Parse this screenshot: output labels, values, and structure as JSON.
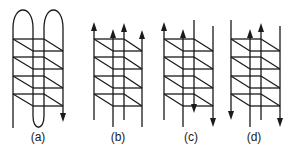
{
  "diagram": {
    "ink_color": "#1a1a1a",
    "background": "#ffffff",
    "rung_tops": [
      39,
      57,
      76,
      94
    ],
    "rung_depth": 12,
    "panels": [
      {
        "id": "a",
        "label": "(a)",
        "label_x": 38,
        "strands": {
          "front_left": 13,
          "back_left": 33,
          "front_right": 44,
          "back_right": 63
        },
        "topology": "single-chain-hairpins",
        "loops": [
          {
            "type": "top",
            "from": "front_left",
            "to": "back_left",
            "apex_y": 10
          },
          {
            "type": "top",
            "from": "front_right",
            "to": "back_right",
            "apex_y": 10
          },
          {
            "type": "bottom",
            "from": "back_left",
            "to": "front_right",
            "apex_y": 127
          }
        ],
        "ends": [
          {
            "strand": "front_left",
            "y": 128,
            "arrow": "none"
          },
          {
            "strand": "back_right",
            "y": 122,
            "arrow": "down"
          }
        ]
      },
      {
        "id": "b",
        "label": "(b)",
        "label_x": 118,
        "strands": {
          "front_left": 94,
          "back_left": 113,
          "front_right": 124,
          "back_right": 142
        },
        "topology": "all-parallel",
        "directions": {
          "front_left": "up",
          "back_left": "up",
          "front_right": "up",
          "back_right": "up"
        }
      },
      {
        "id": "c",
        "label": "(c)",
        "label_x": 191,
        "strands": {
          "front_left": 164,
          "back_left": 183,
          "front_right": 194,
          "back_right": 213
        },
        "topology": "mixed-pairs",
        "directions": {
          "front_left": "up",
          "back_left": "up",
          "front_right": "down",
          "back_right": "down"
        }
      },
      {
        "id": "d",
        "label": "(d)",
        "label_x": 254,
        "strands": {
          "front_left": 231,
          "back_left": 250,
          "front_right": 261,
          "back_right": 280
        },
        "topology": "outer-down-inner-up",
        "directions": {
          "front_left": "down",
          "back_left": "up",
          "front_right": "up",
          "back_right": "down"
        }
      }
    ]
  }
}
